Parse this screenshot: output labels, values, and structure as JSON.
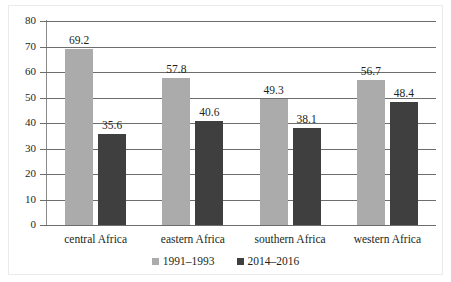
{
  "chart_data": {
    "type": "bar",
    "title": "",
    "xlabel": "",
    "ylabel": "",
    "ylim": [
      0,
      80
    ],
    "yticks": [
      0,
      10,
      20,
      30,
      40,
      50,
      60,
      70,
      80
    ],
    "grid": true,
    "legend_position": "bottom",
    "categories": [
      "central Africa",
      "eastern Africa",
      "southern Africa",
      "western Africa"
    ],
    "series": [
      {
        "name": "1991–1993",
        "color": "#ababab",
        "values": [
          69.2,
          57.8,
          49.3,
          56.7
        ],
        "labels": [
          "69.2",
          "57.8",
          "49.3",
          "56.7"
        ]
      },
      {
        "name": "2014–2016",
        "color": "#3f3f3f",
        "values": [
          35.6,
          40.6,
          38.1,
          48.4
        ],
        "labels": [
          "35.6",
          "40.6",
          "38.1",
          "48.4"
        ]
      }
    ]
  }
}
